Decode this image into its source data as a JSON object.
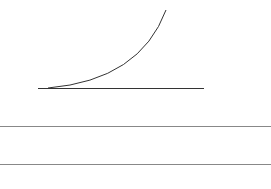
{
  "diagram": {
    "curve": {
      "start": [
        48,
        88
      ],
      "control": [
        140,
        80
      ],
      "end": [
        166,
        10
      ],
      "color": "#333333"
    },
    "baseline": {
      "x1": 38,
      "x2": 204,
      "y": 88,
      "color": "#333333"
    },
    "rules": [
      {
        "y": 126,
        "color": "#888888"
      },
      {
        "y": 164,
        "color": "#888888"
      }
    ]
  }
}
